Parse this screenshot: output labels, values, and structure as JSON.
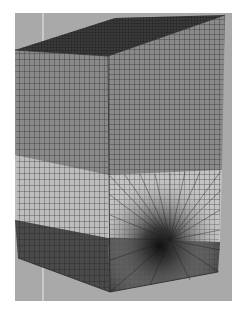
{
  "figure": {
    "background_color": "#ffffff",
    "panel_color": "#a9a9a9",
    "layers": [
      {
        "name": "top-layer",
        "color": "#8a8a8a"
      },
      {
        "name": "middle-layer",
        "color": "#bdbdbd"
      },
      {
        "name": "bottom-layer",
        "color": "#4a4a4a"
      }
    ],
    "top_face_color": "#3a3a3a",
    "mesh_line_color": "#1e1e1e"
  }
}
